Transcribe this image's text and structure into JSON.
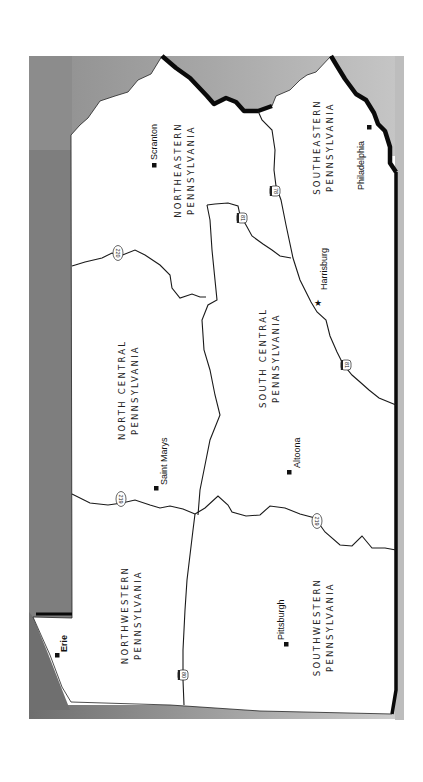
{
  "map": {
    "title": "Pennsylvania Regions",
    "orientation": "rotated 90 degrees clockwise (north faces left)",
    "colors": {
      "background": "#ffffff",
      "outside_state": "#9a9a9a",
      "state_fill": "#ffffff",
      "border": "#0a0a0a",
      "road": "#1a1a1a"
    },
    "regions": [
      {
        "id": "northeastern",
        "line1": "NORTHEASTERN",
        "line2": "PENNSYLVANIA"
      },
      {
        "id": "southeastern",
        "line1": "SOUTHEASTERN",
        "line2": "PENNSYLVANIA"
      },
      {
        "id": "north-central",
        "line1": "NORTH CENTRAL",
        "line2": "PENNSYLVANIA"
      },
      {
        "id": "south-central",
        "line1": "SOUTH CENTRAL",
        "line2": "PENNSYLVANIA"
      },
      {
        "id": "northwestern",
        "line1": "NORTHWESTERN",
        "line2": "PENNSYLVANIA"
      },
      {
        "id": "southwestern",
        "line1": "SOUTHWESTERN",
        "line2": "PENNSYLVANIA"
      }
    ],
    "cities": [
      {
        "name": "Scranton",
        "marker": "square"
      },
      {
        "name": "Philadelphia",
        "marker": "square"
      },
      {
        "name": "Harrisburg",
        "marker": "star"
      },
      {
        "name": "Saint Marys",
        "marker": "square"
      },
      {
        "name": "Altoona",
        "marker": "square"
      },
      {
        "name": "Pittsburgh",
        "marker": "square"
      },
      {
        "name": "Erie",
        "marker": "square"
      }
    ],
    "routes": [
      {
        "number": "78",
        "type": "interstate"
      },
      {
        "number": "81",
        "type": "interstate"
      },
      {
        "number": "81",
        "type": "interstate"
      },
      {
        "number": "220",
        "type": "us-highway"
      },
      {
        "number": "219",
        "type": "us-highway"
      },
      {
        "number": "219",
        "type": "us-highway"
      },
      {
        "number": "80",
        "type": "interstate"
      }
    ]
  }
}
